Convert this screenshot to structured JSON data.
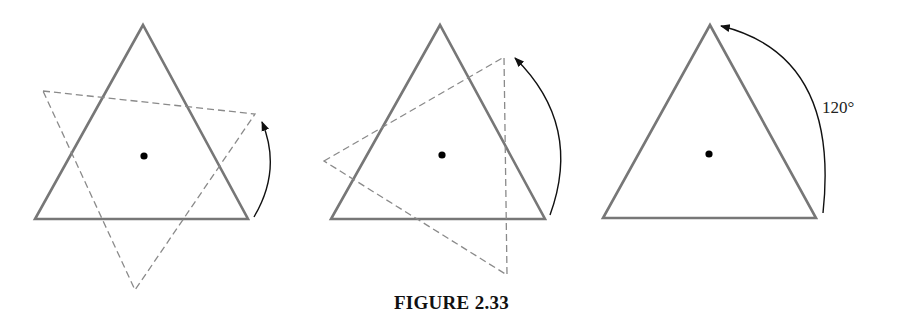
{
  "caption": "FIGURE 2.33",
  "colors": {
    "triangle_stroke": "#777777",
    "dashed_stroke": "#8a8a8a",
    "arc_stroke": "#111111",
    "center_dot": "#000000"
  },
  "panels": [
    {
      "id": "panel-1",
      "solid_triangle": [
        [
          143,
          25
        ],
        [
          35,
          219
        ],
        [
          248,
          219
        ]
      ],
      "dashed_triangle": [
        [
          43,
          91
        ],
        [
          255,
          114
        ],
        [
          135,
          290
        ]
      ],
      "center": [
        144,
        156
      ],
      "arc": {
        "from": [
          254,
          217
        ],
        "ctrl": [
          282,
          170
        ],
        "to": [
          262,
          122
        ]
      },
      "label": ""
    },
    {
      "id": "panel-2",
      "solid_triangle": [
        [
          440,
          25
        ],
        [
          331,
          219
        ],
        [
          545,
          219
        ]
      ],
      "dashed_triangle": [
        [
          324,
          161
        ],
        [
          504,
          57
        ],
        [
          507,
          275
        ]
      ],
      "center": [
        442,
        155
      ],
      "arc": {
        "from": [
          550,
          215
        ],
        "ctrl": [
          583,
          125
        ],
        "to": [
          515,
          58
        ]
      },
      "label": ""
    },
    {
      "id": "panel-3",
      "solid_triangle": [
        [
          710,
          25
        ],
        [
          603,
          218
        ],
        [
          816,
          218
        ]
      ],
      "dashed_triangle": null,
      "center": [
        709,
        154
      ],
      "arc": {
        "from": [
          823,
          213
        ],
        "ctrl": [
          840,
          55
        ],
        "to": [
          721,
          26
        ]
      },
      "label": "120°",
      "label_pos": [
        822,
        113
      ]
    }
  ]
}
